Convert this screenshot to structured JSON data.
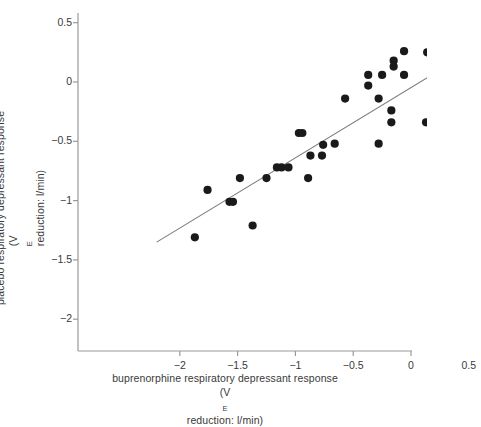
{
  "figure": {
    "x_axis_label_line1": "buprenorphine respiratory depressant response",
    "x_axis_label_line2_pre": "(V",
    "x_axis_label_line2_sub": "E",
    "x_axis_label_line2_post": " reduction: l/min)",
    "y_axis_label_line1": "placebo respiratory depressant response",
    "y_axis_label_line2_pre": "(V",
    "y_axis_label_line2_sub": "E",
    "y_axis_label_line2_post": " reduction: l/min)",
    "marker_color": "#1a1a1a",
    "line_color": "#7a7a7a",
    "axis_color": "#9a9a9a"
  },
  "chart_data": {
    "type": "scatter",
    "title": "",
    "xlabel": "buprenorphine respiratory depressant response (VE reduction: l/min)",
    "ylabel": "placebo respiratory depressant response (VE reduction: l/min)",
    "xlim": [
      -2.2,
      0.55
    ],
    "ylim": [
      -2.35,
      0.6
    ],
    "xticks": [
      -2,
      -1.5,
      -1,
      -0.5,
      0,
      0.5
    ],
    "xticklabels": [
      "−2",
      "−1.5",
      "−1",
      "−0.5",
      "0",
      "0.5"
    ],
    "yticks": [
      0.5,
      0,
      -0.5,
      -1,
      -1.5,
      -2
    ],
    "yticklabels": [
      "0.5",
      "0",
      "−0.5",
      "−1",
      "−1.5",
      "−2"
    ],
    "grid": false,
    "legend": null,
    "points": [
      {
        "x": -1.87,
        "y": -1.31
      },
      {
        "x": -1.76,
        "y": -0.91
      },
      {
        "x": -1.57,
        "y": -1.01
      },
      {
        "x": -1.54,
        "y": -1.01
      },
      {
        "x": -1.48,
        "y": -0.81
      },
      {
        "x": -1.37,
        "y": -1.21
      },
      {
        "x": -1.25,
        "y": -0.81
      },
      {
        "x": -1.16,
        "y": -0.72
      },
      {
        "x": -1.12,
        "y": -0.72
      },
      {
        "x": -1.06,
        "y": -0.72
      },
      {
        "x": -0.97,
        "y": -0.43
      },
      {
        "x": -0.94,
        "y": -0.43
      },
      {
        "x": -0.89,
        "y": -0.81
      },
      {
        "x": -0.87,
        "y": -0.62
      },
      {
        "x": -0.77,
        "y": -0.62
      },
      {
        "x": -0.76,
        "y": -0.53
      },
      {
        "x": -0.66,
        "y": -0.52
      },
      {
        "x": -0.57,
        "y": -0.14
      },
      {
        "x": -0.37,
        "y": 0.06
      },
      {
        "x": -0.37,
        "y": -0.03
      },
      {
        "x": -0.28,
        "y": -0.14
      },
      {
        "x": -0.28,
        "y": -0.52
      },
      {
        "x": -0.25,
        "y": 0.06
      },
      {
        "x": -0.17,
        "y": -0.24
      },
      {
        "x": -0.17,
        "y": -0.34
      },
      {
        "x": -0.15,
        "y": 0.18
      },
      {
        "x": -0.15,
        "y": 0.13
      },
      {
        "x": -0.06,
        "y": 0.26
      },
      {
        "x": -0.06,
        "y": 0.06
      },
      {
        "x": 0.13,
        "y": -0.34
      },
      {
        "x": 0.14,
        "y": 0.25
      },
      {
        "x": 0.22,
        "y": -0.14
      },
      {
        "x": 0.23,
        "y": -0.34
      }
    ],
    "fit_line": {
      "x0": -2.2,
      "y0": -1.35,
      "x1": 0.45,
      "y1": 0.22
    }
  }
}
